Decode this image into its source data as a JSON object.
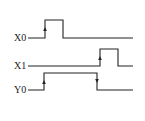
{
  "diagram": {
    "type": "timing",
    "colors": {
      "line": "#222222",
      "background": "#ffffff"
    },
    "signals": [
      {
        "name": "X0",
        "label_pos": [
          14,
          41
        ],
        "points": "28,38 45,38 45,20 63,20 63,38 133,38",
        "arrows": [
          {
            "dir": "up",
            "x": 45,
            "y": 29
          }
        ]
      },
      {
        "name": "X1",
        "label_pos": [
          14,
          69
        ],
        "points": "28,66 100,66 100,49 118,49 118,66 133,66",
        "arrows": [
          {
            "dir": "up",
            "x": 100,
            "y": 58
          }
        ]
      },
      {
        "name": "Y0",
        "label_pos": [
          14,
          93
        ],
        "points": "28,90 44,90 44,73 97,73 97,90 133,90",
        "arrows": [
          {
            "dir": "up",
            "x": 44,
            "y": 82
          },
          {
            "dir": "down",
            "x": 97,
            "y": 81
          }
        ]
      }
    ]
  }
}
